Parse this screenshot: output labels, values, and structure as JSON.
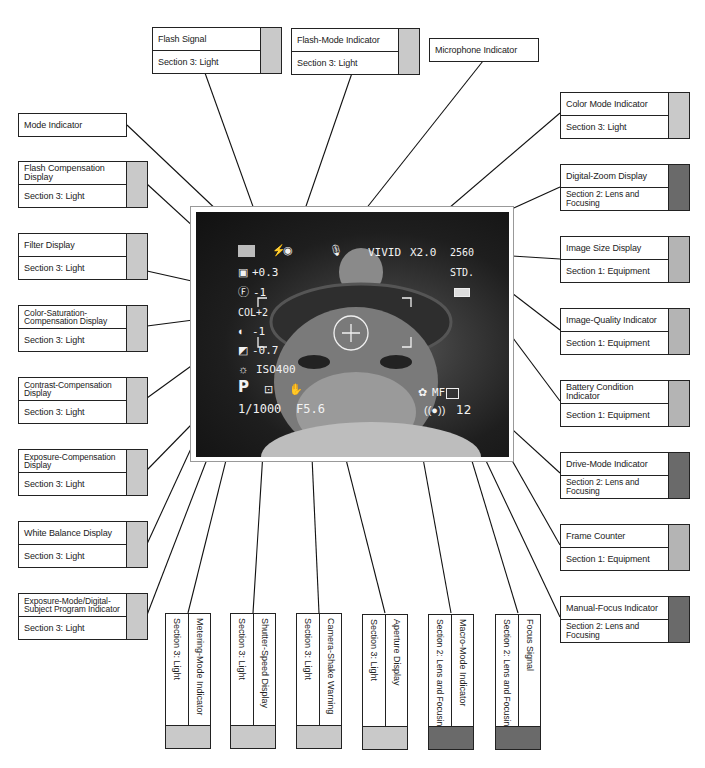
{
  "swatch_colors": {
    "light": "#c9c9c9",
    "equipment": "#b4b4b4",
    "lens": "#6a6a6a"
  },
  "labels": {
    "flash_signal": {
      "title": "Flash Signal",
      "section": "Section 3: Light"
    },
    "flash_mode": {
      "title": "Flash-Mode Indicator",
      "section": "Section 3: Light"
    },
    "microphone": {
      "title": "Microphone Indicator"
    },
    "mode": {
      "title": "Mode Indicator"
    },
    "flash_comp": {
      "title": "Flash Compensation Display",
      "section": "Section 3: Light"
    },
    "filter": {
      "title": "Filter Display",
      "section": "Section 3: Light"
    },
    "color_sat": {
      "title": "Color-Saturation-Compensation Display",
      "section": "Section 3: Light"
    },
    "contrast": {
      "title": "Contrast-Compensation Display",
      "section": "Section 3: Light"
    },
    "exposure_comp": {
      "title": "Exposure-Compensation Display",
      "section": "Section 3: Light"
    },
    "white_balance": {
      "title": "White Balance Display",
      "section": "Section 3: Light"
    },
    "exposure_mode": {
      "title": "Exposure-Mode/Digital-Subject Program Indicator",
      "section": "Section 3: Light"
    },
    "color_mode": {
      "title": "Color Mode Indicator",
      "section": "Section 3: Light"
    },
    "digital_zoom": {
      "title": "Digital-Zoom Display",
      "section": "Section 2: Lens and Focusing"
    },
    "image_size": {
      "title": "Image Size Display",
      "section": "Section 1: Equipment"
    },
    "image_quality": {
      "title": "Image-Quality Indicator",
      "section": "Section 1: Equipment"
    },
    "battery": {
      "title": "Battery Condition Indicator",
      "section": "Section 1: Equipment"
    },
    "drive_mode": {
      "title": "Drive-Mode Indicator",
      "section": "Section 2: Lens and Focusing"
    },
    "frame_counter": {
      "title": "Frame Counter",
      "section": "Section 1: Equipment"
    },
    "manual_focus": {
      "title": "Manual-Focus Indicator",
      "section": "Section 2: Lens and Focusing"
    },
    "metering": {
      "title": "Metering-Mode Indicator",
      "section": "Section 3: Light"
    },
    "shutter": {
      "title": "Shutter-Speed Display",
      "section": "Section 3: Light"
    },
    "camera_shake": {
      "title": "Camera-Shake Warning",
      "section": "Section 3: Light"
    },
    "aperture": {
      "title": "Aperture Display",
      "section": "Section 3: Light"
    },
    "macro": {
      "title": "Macro-Mode Indicator",
      "section": "Section 2: Lens and Focusing"
    },
    "focus_signal": {
      "title": "Focus Signal",
      "section": "Section 2: Lens and Focusing"
    }
  },
  "screen": {
    "flash_comp": "+0.3",
    "filter": "-1",
    "color_sat": "COL+2",
    "contrast": "-1",
    "exposure_comp": "-0.7",
    "iso": "ISO400",
    "exposure_mode": "P",
    "shutter": "1/1000",
    "aperture": "F5.6",
    "color_mode": "VIVID",
    "zoom": "X2.0",
    "image_size": "2560",
    "quality": "STD.",
    "focus_mode": "MF",
    "frame_count": "12"
  },
  "icons": {
    "mode": "camera-mode-icon",
    "flash": "flash-bolt-icon",
    "red_eye": "red-eye-icon",
    "mic": "microphone-icon",
    "battery": "battery-icon",
    "white_balance": "sun-icon",
    "metering": "spot-metering-icon",
    "shake": "hand-shake-icon",
    "macro": "flower-macro-icon",
    "drive": "single-frame-icon",
    "focus": "focus-signal-icon"
  }
}
